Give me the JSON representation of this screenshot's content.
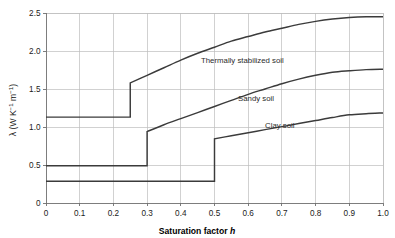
{
  "chart_data": {
    "type": "line",
    "title": "",
    "xlabel": "Saturation factor h",
    "ylabel": "λ (W K⁻¹ m⁻¹)",
    "ylabel_parts": {
      "symbol": "λ",
      "open": " (W K",
      "sup1": "−1",
      "mid": " m",
      "sup2": "−1",
      "close": ")"
    },
    "xlabel_parts": {
      "text": "Saturation factor ",
      "italic": "h"
    },
    "xlim": [
      0,
      1.0
    ],
    "ylim": [
      0,
      2.5
    ],
    "xticks": [
      "0",
      "0.1",
      "0.2",
      "0.3",
      "0.4",
      "0.5",
      "0.6",
      "0.7",
      "0.8",
      "0.9",
      "1.0"
    ],
    "xtick_values": [
      0,
      0.1,
      0.2,
      0.3,
      0.4,
      0.5,
      0.6,
      0.7,
      0.8,
      0.9,
      1.0
    ],
    "yticks": [
      "0",
      "0.5",
      "1.0",
      "1.5",
      "2.0",
      "2.5"
    ],
    "ytick_values": [
      0,
      0.5,
      1.0,
      1.5,
      2.0,
      2.5
    ],
    "grid": true,
    "legend_position": "inline-annotations",
    "line_color": "#3b3b3b",
    "grid_color": "#bdbdbd",
    "axis_color": "#6f6f6f",
    "background_color": "#ffffff",
    "series": [
      {
        "name": "Thermally stabilized soil",
        "label_x": 0.46,
        "label_y": 1.84,
        "step_at": 0.25,
        "x": [
          0.0,
          0.05,
          0.1,
          0.15,
          0.2,
          0.25,
          0.25,
          0.3,
          0.35,
          0.4,
          0.45,
          0.5,
          0.55,
          0.6,
          0.65,
          0.7,
          0.75,
          0.8,
          0.85,
          0.9,
          0.95,
          1.0
        ],
        "values": [
          1.13,
          1.13,
          1.13,
          1.13,
          1.13,
          1.13,
          1.58,
          1.68,
          1.78,
          1.88,
          1.97,
          2.05,
          2.13,
          2.19,
          2.25,
          2.3,
          2.35,
          2.39,
          2.42,
          2.44,
          2.45,
          2.45
        ]
      },
      {
        "name": "Sandy soil",
        "label_x": 0.57,
        "label_y": 1.34,
        "step_at": 0.3,
        "x": [
          0.0,
          0.05,
          0.1,
          0.15,
          0.2,
          0.25,
          0.3,
          0.3,
          0.35,
          0.4,
          0.45,
          0.5,
          0.55,
          0.6,
          0.65,
          0.7,
          0.75,
          0.8,
          0.85,
          0.9,
          0.95,
          1.0
        ],
        "values": [
          0.49,
          0.49,
          0.49,
          0.49,
          0.49,
          0.49,
          0.49,
          0.94,
          1.03,
          1.11,
          1.19,
          1.27,
          1.35,
          1.43,
          1.5,
          1.57,
          1.63,
          1.68,
          1.72,
          1.74,
          1.755,
          1.76
        ]
      },
      {
        "name": "Clay soil",
        "label_x": 0.65,
        "label_y": 0.99,
        "step_at": 0.5,
        "x": [
          0.0,
          0.1,
          0.2,
          0.3,
          0.4,
          0.5,
          0.5,
          0.55,
          0.6,
          0.65,
          0.7,
          0.75,
          0.8,
          0.85,
          0.9,
          0.95,
          1.0
        ],
        "values": [
          0.285,
          0.285,
          0.285,
          0.285,
          0.285,
          0.285,
          0.845,
          0.885,
          0.925,
          0.965,
          1.005,
          1.045,
          1.085,
          1.125,
          1.16,
          1.175,
          1.185
        ]
      }
    ]
  }
}
